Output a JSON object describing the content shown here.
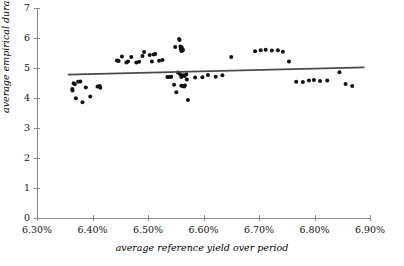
{
  "chart_data": {
    "type": "scatter",
    "title": "",
    "xlabel": "average reference yield over period",
    "ylabel": "average empirical duration over period",
    "xlim": [
      6.3,
      6.9
    ],
    "ylim": [
      0,
      7
    ],
    "xticks": [
      6.3,
      6.4,
      6.5,
      6.6,
      6.7,
      6.8,
      6.9
    ],
    "xtick_labels": [
      "6.30%",
      "6.40%",
      "6.50%",
      "6.60%",
      "6.70%",
      "6.80%",
      "6.90%"
    ],
    "yticks": [
      0,
      1,
      2,
      3,
      4,
      5,
      6,
      7
    ],
    "ytick_labels": [
      "0",
      "1",
      "2",
      "3",
      "4",
      "5",
      "6",
      "7"
    ],
    "grid": false,
    "legend": null,
    "point_color": "#111111",
    "point_size": 2.0,
    "axis_color": "#8a8a8a",
    "trend_color": "#4a4a4a",
    "series": [
      {
        "name": "average empirical duration vs average reference yield",
        "marker": "filled-circle",
        "points": [
          [
            6.3635,
            4.3
          ],
          [
            6.364,
            4.25
          ],
          [
            6.366,
            4.49
          ],
          [
            6.368,
            4.46
          ],
          [
            6.37,
            3.99
          ],
          [
            6.374,
            4.54
          ],
          [
            6.378,
            4.55
          ],
          [
            6.382,
            3.86
          ],
          [
            6.388,
            4.35
          ],
          [
            6.396,
            4.05
          ],
          [
            6.409,
            4.38
          ],
          [
            6.413,
            4.4
          ],
          [
            6.414,
            4.34
          ],
          [
            6.444,
            5.25
          ],
          [
            6.447,
            5.23
          ],
          [
            6.453,
            5.38
          ],
          [
            6.461,
            5.18
          ],
          [
            6.464,
            5.22
          ],
          [
            6.47,
            5.37
          ],
          [
            6.479,
            5.18
          ],
          [
            6.484,
            5.21
          ],
          [
            6.49,
            5.4
          ],
          [
            6.493,
            5.53
          ],
          [
            6.503,
            5.43
          ],
          [
            6.507,
            5.22
          ],
          [
            6.51,
            5.45
          ],
          [
            6.513,
            5.47
          ],
          [
            6.52,
            5.24
          ],
          [
            6.526,
            5.27
          ],
          [
            6.535,
            4.7
          ],
          [
            6.539,
            4.7
          ],
          [
            6.542,
            4.71
          ],
          [
            6.549,
            5.7
          ],
          [
            6.551,
            4.19
          ],
          [
            6.556,
            5.97
          ],
          [
            6.557,
            5.93
          ],
          [
            6.5585,
            5.72
          ],
          [
            6.559,
            5.64
          ],
          [
            6.56,
            5.57
          ],
          [
            6.5605,
            5.69
          ],
          [
            6.5615,
            5.62
          ],
          [
            6.562,
            5.58
          ],
          [
            6.563,
            5.61
          ],
          [
            6.554,
            4.85
          ],
          [
            6.558,
            4.79
          ],
          [
            6.56,
            4.7
          ],
          [
            6.564,
            4.76
          ],
          [
            6.566,
            4.73
          ],
          [
            6.569,
            4.79
          ],
          [
            6.57,
            4.62
          ],
          [
            6.547,
            4.44
          ],
          [
            6.56,
            4.41
          ],
          [
            6.563,
            4.4
          ],
          [
            6.565,
            4.38
          ],
          [
            6.5665,
            4.42
          ],
          [
            6.572,
            3.93
          ],
          [
            6.585,
            4.68
          ],
          [
            6.598,
            4.69
          ],
          [
            6.608,
            4.77
          ],
          [
            6.622,
            4.71
          ],
          [
            6.634,
            4.76
          ],
          [
            6.65,
            5.37
          ],
          [
            6.693,
            5.56
          ],
          [
            6.703,
            5.59
          ],
          [
            6.712,
            5.61
          ],
          [
            6.723,
            5.58
          ],
          [
            6.734,
            5.59
          ],
          [
            6.743,
            5.54
          ],
          [
            6.754,
            5.22
          ],
          [
            6.767,
            4.54
          ],
          [
            6.779,
            4.53
          ],
          [
            6.79,
            4.58
          ],
          [
            6.799,
            4.6
          ],
          [
            6.81,
            4.57
          ],
          [
            6.823,
            4.58
          ],
          [
            6.845,
            4.86
          ],
          [
            6.856,
            4.47
          ],
          [
            6.868,
            4.4
          ]
        ]
      }
    ],
    "trendline": {
      "name": "linear fit",
      "x_start": 6.3555,
      "y_start": 4.78,
      "x_end": 6.89,
      "y_end": 5.02
    }
  }
}
